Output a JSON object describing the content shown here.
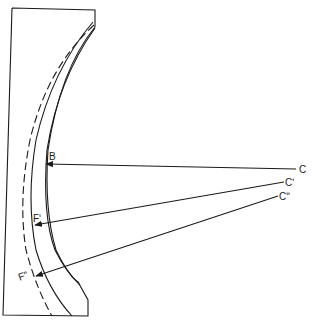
{
  "diagram": {
    "type": "optics-concave-mirror-ray-diagram",
    "colors": {
      "stroke": "#1a1a1a",
      "background": "#ffffff"
    },
    "labels": {
      "B": "B",
      "C": "C",
      "C1": "Cʹ",
      "C2": "Cʺ",
      "F1": "Fʹ",
      "F2": "Fʺ"
    },
    "rays": [
      {
        "from": "C",
        "to": "B"
      },
      {
        "from": "Cʹ",
        "to": "Fʹ"
      },
      {
        "from": "Cʺ",
        "to": "Fʺ"
      }
    ],
    "curves": [
      {
        "name": "outer-surface",
        "style": "solid"
      },
      {
        "name": "inner-surface",
        "style": "solid"
      },
      {
        "name": "focal-surface",
        "style": "dashed"
      }
    ]
  }
}
